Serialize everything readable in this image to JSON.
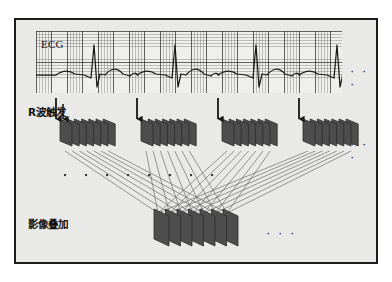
{
  "figure": {
    "title_hidden": "",
    "background": "#e9e9e7",
    "border_color": "#1c1c1c"
  },
  "labels": {
    "ecg": "ECG",
    "r_wave_trigger": "R波触发",
    "image_summation": "影像叠加",
    "ecg_continues": "· · ·",
    "slabs_continue": "· · ·",
    "sum_continues": "· · ·"
  },
  "colors": {
    "slab_face": "#4d4d4d",
    "slab_edge": "#2b2b2b",
    "slab_top": "#6b6b6b",
    "grid_minor": "#8a8a8a",
    "grid_major": "#3c3c3c",
    "trace": "#1a1a1a",
    "arrow": "#171717",
    "ray": "#6d6d6d",
    "dot": "#3a3a3a",
    "panel": "#efefed"
  },
  "chart_data": {
    "type": "line",
    "xlabel": "",
    "ylabel": "",
    "grid": true,
    "legend": "none",
    "series": [
      {
        "name": "ECG",
        "description": "Four-beat rhythm strip with P wave, sharp R spike, S dip and T wave per cycle",
        "beat_count": 4,
        "r_peak_x": [
          58,
          139,
          220,
          301
        ],
        "baseline_y": 44,
        "r_peak_y": 14,
        "s_trough_y": 56,
        "cycle_period_px": 81
      }
    ],
    "triggers": {
      "count": 4,
      "x": [
        58,
        139,
        220,
        301
      ],
      "label": "R波触发"
    },
    "slab_groups": [
      {
        "index": 1,
        "x": 44,
        "slab_count": 7
      },
      {
        "index": 2,
        "x": 125,
        "slab_count": 7
      },
      {
        "index": 3,
        "x": 206,
        "slab_count": 7
      },
      {
        "index": 4,
        "x": 287,
        "slab_count": 7
      }
    ],
    "summation_stack": {
      "x": 138,
      "y": 196,
      "slab_count": 7,
      "label": "影像叠加"
    },
    "dot_row": {
      "y": 154,
      "count": 8,
      "x_start": 48,
      "x_step": 21
    }
  }
}
